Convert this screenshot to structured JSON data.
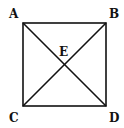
{
  "diagram": {
    "type": "square-with-diagonals",
    "labels": {
      "A": "A",
      "B": "B",
      "C": "C",
      "D": "D",
      "E": "E"
    },
    "stroke_color": "#111111",
    "background": "#ffffff"
  }
}
